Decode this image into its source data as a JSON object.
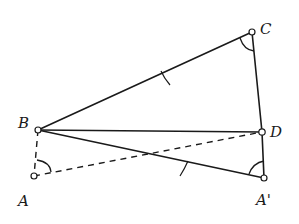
{
  "diagram": {
    "type": "geometry-construction",
    "points": {
      "A": {
        "label": "A",
        "x": 34,
        "y": 176,
        "lx": 18,
        "ly": 206
      },
      "B": {
        "label": "B",
        "x": 38,
        "y": 130,
        "lx": 18,
        "ly": 128
      },
      "C": {
        "label": "C",
        "x": 252,
        "y": 32,
        "lx": 260,
        "ly": 34
      },
      "D": {
        "label": "D",
        "x": 262,
        "y": 132,
        "lx": 270,
        "ly": 137
      },
      "A1": {
        "label": "A'",
        "x": 264,
        "y": 178,
        "lx": 256,
        "ly": 205
      }
    },
    "segments": [
      {
        "from": "B",
        "to": "C",
        "style": "solid",
        "tick": true
      },
      {
        "from": "C",
        "to": "D",
        "style": "solid",
        "tick": false
      },
      {
        "from": "D",
        "to": "A1",
        "style": "solid",
        "tick": false
      },
      {
        "from": "B",
        "to": "D",
        "style": "solid",
        "tick": false
      },
      {
        "from": "B",
        "to": "A1",
        "style": "solid",
        "tick": true
      },
      {
        "from": "B",
        "to": "A",
        "style": "dashed",
        "tick": false
      },
      {
        "from": "A",
        "to": "D",
        "style": "dashed",
        "tick": false
      }
    ],
    "angle_marks": [
      "C",
      "A1",
      "A"
    ],
    "colors": {
      "ink": "#1a1a1a",
      "background": "#ffffff"
    }
  }
}
